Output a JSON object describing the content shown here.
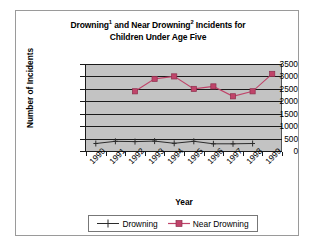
{
  "chart_data": {
    "type": "line",
    "title_line1_pre": "Drowning",
    "title_line1_sup1": "1",
    "title_line1_mid": " and Near Drowning",
    "title_line1_sup2": "2",
    "title_line1_post": " Incidents for",
    "title_line2": "Children Under Age Five",
    "xlabel": "Year",
    "ylabel": "Number of Incidents",
    "categories": [
      "1990",
      "1991",
      "1992",
      "1993",
      "1994",
      "1995",
      "1996",
      "1997",
      "1998",
      "1999"
    ],
    "yticks": [
      "3500",
      "3000",
      "2500",
      "2000",
      "1500",
      "1000",
      "500",
      "0"
    ],
    "ylim": [
      0,
      3500
    ],
    "ytick_step": 500,
    "grid": "horizontal",
    "legend_position": "bottom",
    "plot_background": "#c3c3c3",
    "series": [
      {
        "name": "Drowning",
        "color": "#2b2b2b",
        "marker": "plus",
        "values": [
          300,
          390,
          380,
          400,
          310,
          390,
          290,
          290,
          300,
          null
        ]
      },
      {
        "name": "Near Drowning",
        "color": "#c0446a",
        "marker": "square",
        "values": [
          null,
          null,
          2400,
          2900,
          3000,
          2500,
          2600,
          2200,
          2400,
          3100
        ]
      }
    ]
  },
  "legend": {
    "items": [
      {
        "label": "Drowning"
      },
      {
        "label": "Near Drowning"
      }
    ]
  }
}
